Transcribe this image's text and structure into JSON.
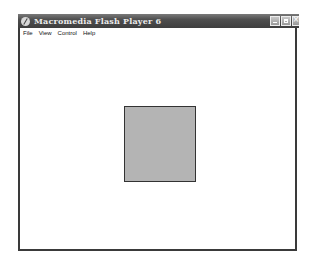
{
  "window": {
    "title": "Macromedia Flash Player 6",
    "icon": "flash-player-icon",
    "controls": [
      "minimize-icon",
      "maximize-icon",
      "close-icon"
    ]
  },
  "menubar": {
    "items": [
      {
        "label": "File"
      },
      {
        "label": "View"
      },
      {
        "label": "Control"
      },
      {
        "label": "Help"
      }
    ]
  },
  "stage": {
    "background": "#ffffff",
    "shapes": [
      {
        "type": "rectangle",
        "fill": "#b4b4b4",
        "stroke": "#333333"
      }
    ]
  }
}
